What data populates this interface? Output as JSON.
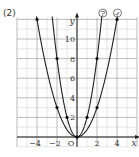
{
  "problem_label": "(2)",
  "chart_data": {
    "type": "line",
    "title": "",
    "xlabel": "x",
    "ylabel": "y",
    "origin_label": "O",
    "xlim": [
      -6,
      6
    ],
    "ylim": [
      -1,
      12
    ],
    "grid": true,
    "x_ticks": [
      -4,
      -2,
      2,
      4
    ],
    "y_ticks": [
      2,
      4,
      6,
      8,
      10
    ],
    "series": [
      {
        "name": "ア",
        "label": "㋐",
        "equation": "y = 2x^2",
        "points": [
          [
            -2,
            8
          ],
          [
            -1,
            2
          ],
          [
            0,
            0
          ],
          [
            1,
            2
          ],
          [
            2,
            8
          ]
        ]
      },
      {
        "name": "イ",
        "label": "㋑",
        "equation": "y = 3/4 x^2",
        "points": [
          [
            -4,
            12
          ],
          [
            -2,
            3
          ],
          [
            0,
            0
          ],
          [
            2,
            3
          ],
          [
            4,
            12
          ]
        ]
      }
    ]
  }
}
